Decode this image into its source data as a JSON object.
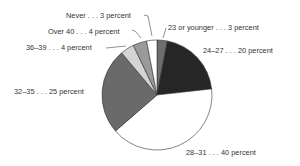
{
  "chart_data": {
    "type": "pie",
    "title": "",
    "start_angle_deg": 0,
    "direction": "clockwise",
    "slices": [
      {
        "label": "23 or younger",
        "value": 3,
        "text": "23 or younger . . . 3 percent",
        "color": "#6e6e6e"
      },
      {
        "label": "24–27",
        "value": 20,
        "text": "24–27 . . . 20 percent",
        "color": "#262626"
      },
      {
        "label": "28–31",
        "value": 40,
        "text": "28–31 . . . 40 percent",
        "color": "#ffffff"
      },
      {
        "label": "32–35",
        "value": 25,
        "text": "32–35 . . . 25 percent",
        "color": "#6a6a6a"
      },
      {
        "label": "36–39",
        "value": 4,
        "text": "36–39 . . . 4 percent",
        "color": "#d4d4d4"
      },
      {
        "label": "Over 40",
        "value": 4,
        "text": "Over 40 . . . 4 percent",
        "color": "#9a9a9a"
      },
      {
        "label": "Never",
        "value": 3,
        "text": "Never . . . 3 percent",
        "color": "#ffffff"
      }
    ],
    "unit": "percent",
    "legend": "none (callout labels)"
  },
  "labels": {
    "young": "23 or younger . . . 3 percent",
    "l2427": "24–27 . . . 20 percent",
    "l2831": "28–31 . . . 40 percent",
    "l3235": "32–35 . . . 25 percent",
    "l3639": "36–39 . . . 4 percent",
    "over40": "Over 40 . . . 4 percent",
    "never": "Never . . . 3 percent"
  }
}
